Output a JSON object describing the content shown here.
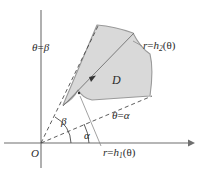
{
  "figure": {
    "colors": {
      "region_fill": "#d9d9d9",
      "region_stroke": "#9a9a9a",
      "axis": "#6f6f6f",
      "dashed_ray": "#4a4a4a",
      "text": "#2b2b2b",
      "background": "#ffffff"
    }
  },
  "labels": {
    "origin": "O",
    "region": "D",
    "theta_beta": {
      "theta": "θ",
      "equals": "=",
      "value": "β"
    },
    "theta_alpha": {
      "theta": "θ",
      "equals": "=",
      "value": "α"
    },
    "outer_curve": {
      "r": "r",
      "equals": "=",
      "fn": "h",
      "sub": "2",
      "arg": "(θ)"
    },
    "inner_curve": {
      "r": "r",
      "equals": "=",
      "fn": "h",
      "sub": "1",
      "arg": "(θ)"
    },
    "angle_beta": "β",
    "angle_alpha": "α"
  },
  "geometry": {
    "origin": {
      "x": 41,
      "y": 143
    },
    "axes": {
      "x_axis": {
        "x1": 4,
        "y1": 143,
        "x2": 194,
        "y2": 143,
        "arrow": "right"
      },
      "y_axis": {
        "x1": 41,
        "y1": 166,
        "x2": 41,
        "y2": 10,
        "arrow": "none"
      }
    },
    "rays": [
      {
        "name": "theta-beta-ray",
        "angle_deg": 62,
        "dashed": true
      },
      {
        "name": "theta-alpha-ray",
        "angle_deg": 27,
        "dashed": true
      }
    ],
    "angle_arcs": [
      {
        "name": "beta-arc",
        "radius": 30,
        "from_deg": 0,
        "to_deg": 62
      },
      {
        "name": "alpha-arc",
        "radius": 48,
        "from_deg": 0,
        "to_deg": 27
      }
    ],
    "direction_arrow": {
      "name": "radial-direction-arrow",
      "along": "theta-between-ray"
    }
  }
}
